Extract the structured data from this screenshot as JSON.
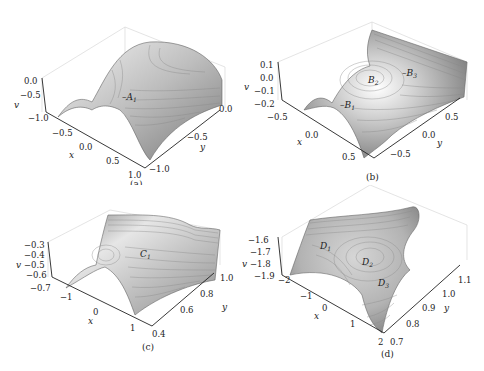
{
  "figure": {
    "panels": [
      {
        "id": "a",
        "caption": "(a)",
        "v_axis": {
          "label": "v",
          "ticks": [
            "0.0",
            "-0.5",
            "-1.0"
          ]
        },
        "x_axis": {
          "label": "x",
          "ticks": [
            "-0.5",
            "0.0",
            "0.5",
            "1.0"
          ]
        },
        "y_axis": {
          "label": "y",
          "ticks": [
            "0.0",
            "-0.5",
            "-1.0"
          ]
        },
        "points": [
          {
            "name": "A",
            "sub": "1"
          }
        ]
      },
      {
        "id": "b",
        "caption": "(b)",
        "v_axis": {
          "label": "v",
          "ticks": [
            "0.1",
            "0.0",
            "-0.1",
            "-0.2"
          ]
        },
        "x_axis": {
          "label": "x",
          "ticks": [
            "-0.5",
            "0.0",
            "0.5"
          ]
        },
        "y_axis": {
          "label": "y",
          "ticks": [
            "0.5",
            "0.0",
            "-0.5"
          ]
        },
        "points": [
          {
            "name": "B",
            "sub": "1"
          },
          {
            "name": "B",
            "sub": "2"
          },
          {
            "name": "B",
            "sub": "3"
          }
        ]
      },
      {
        "id": "c",
        "caption": "(c)",
        "v_axis": {
          "label": "v",
          "ticks": [
            "-0.3",
            "-0.4",
            "-0.5",
            "-0.6",
            "-0.7"
          ]
        },
        "x_axis": {
          "label": "x",
          "ticks": [
            "-1",
            "0",
            "1"
          ]
        },
        "y_axis": {
          "label": "y",
          "ticks": [
            "1.0",
            "0.8",
            "0.6",
            "0.4"
          ]
        },
        "points": [
          {
            "name": "C",
            "sub": "1"
          }
        ]
      },
      {
        "id": "d",
        "caption": "(d)",
        "v_axis": {
          "label": "v",
          "ticks": [
            "-1.6",
            "-1.7",
            "-1.8",
            "-1.9"
          ]
        },
        "x_axis": {
          "label": "x",
          "ticks": [
            "-2",
            "-1",
            "0",
            "1",
            "2"
          ]
        },
        "y_axis": {
          "label": "y",
          "ticks": [
            "1.1",
            "1.0",
            "0.9",
            "0.8",
            "0.7"
          ]
        },
        "points": [
          {
            "name": "D",
            "sub": "1"
          },
          {
            "name": "D",
            "sub": "2"
          },
          {
            "name": "D",
            "sub": "3"
          }
        ]
      }
    ]
  }
}
